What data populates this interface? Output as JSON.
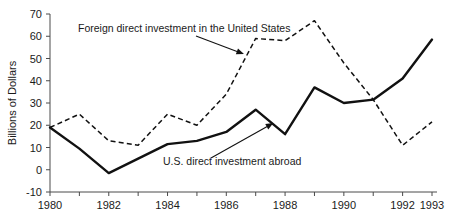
{
  "chart_data": {
    "type": "line",
    "title": "",
    "xlabel": "",
    "ylabel": "Billions of Dollars",
    "x": [
      1980,
      1981,
      1982,
      1983,
      1984,
      1985,
      1986,
      1987,
      1988,
      1989,
      1990,
      1991,
      1992,
      1993
    ],
    "xlim": [
      1980,
      1993
    ],
    "ylim": [
      -10,
      70
    ],
    "grid": false,
    "legend_position": "none",
    "x_tick_labels": [
      "1980",
      "1982",
      "1984",
      "1986",
      "1988",
      "1990",
      "1992",
      "1993"
    ],
    "x_tick_values": [
      1980,
      1982,
      1984,
      1986,
      1988,
      1990,
      1992,
      1993
    ],
    "x_minor_tick_values": [
      1981,
      1983,
      1985,
      1987,
      1989,
      1991
    ],
    "y_tick_labels": [
      "-10",
      "0",
      "10",
      "20",
      "30",
      "40",
      "50",
      "60",
      "70"
    ],
    "y_tick_values": [
      -10,
      0,
      10,
      20,
      30,
      40,
      50,
      60,
      70
    ],
    "series": [
      {
        "name": "U.S. direct investment abroad",
        "style": "solid",
        "values": [
          19,
          9.5,
          -1.5,
          5,
          11.5,
          13,
          17,
          27,
          16,
          37,
          30,
          31.5,
          41,
          58.5
        ]
      },
      {
        "name": "Foreign direct investment in the United States",
        "style": "dashed",
        "values": [
          19,
          25,
          13,
          11,
          25,
          20,
          34,
          59,
          58,
          67,
          48,
          31.5,
          11,
          21.5
        ]
      }
    ],
    "annotations": [
      {
        "text": "Foreign direct investment in the United States",
        "target_x": 1986.6,
        "target_y": 52
      },
      {
        "text": "U.S. direct investment abroad",
        "target_x": 1987.6,
        "target_y": 21
      }
    ]
  }
}
